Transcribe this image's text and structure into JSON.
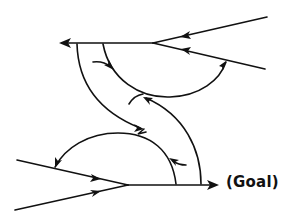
{
  "diagram": {
    "type": "flow-paths",
    "goal_label": "(Goal)",
    "stroke_color": "#111111",
    "background": "#ffffff",
    "elements": [
      {
        "id": "upper-right-top-line",
        "direction": "toward-junction"
      },
      {
        "id": "upper-right-bottom-line",
        "direction": "toward-junction"
      },
      {
        "id": "upper-horizontal-line",
        "direction": "leftward"
      },
      {
        "id": "lower-left-top-line",
        "direction": "toward-junction"
      },
      {
        "id": "lower-left-bottom-line",
        "direction": "toward-junction"
      },
      {
        "id": "lower-horizontal-line",
        "direction": "rightward-to-goal"
      },
      {
        "id": "upper-arc",
        "direction": "curving-up-to-right-line"
      },
      {
        "id": "left-s-curve",
        "direction": "downward"
      },
      {
        "id": "right-s-curve",
        "direction": "upward"
      },
      {
        "id": "lower-arc",
        "direction": "curving-to-left-line"
      }
    ]
  }
}
